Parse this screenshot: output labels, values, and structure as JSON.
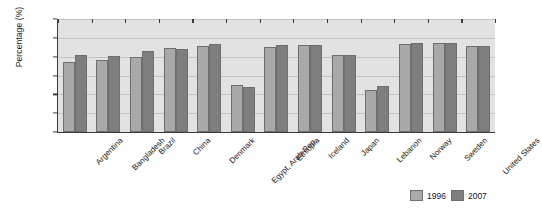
{
  "chart_data": {
    "type": "bar",
    "title": "",
    "xlabel": "",
    "ylabel": "Percentage (%)",
    "ylim": [
      0,
      60
    ],
    "ytick_step": 10,
    "ytick_labels": [
      "0.0",
      "10.0",
      "20.0",
      "30.0",
      "40.0",
      "50.0",
      "60.0"
    ],
    "grid": true,
    "legend_position": "bottom-right",
    "categories": [
      "Argentina",
      "Bangladesh",
      "Brazil",
      "China",
      "Denmark",
      "Egypt, Arab Rep.",
      "Ethiopia",
      "Iceland",
      "Japan",
      "Lebanon",
      "Norway",
      "Sweden",
      "United States"
    ],
    "series": [
      {
        "name": "1996",
        "color": "#a9a9a9",
        "values": [
          37.0,
          38.5,
          40.0,
          44.5,
          45.5,
          25.0,
          45.0,
          46.0,
          41.0,
          22.5,
          46.5,
          47.0,
          45.5
        ]
      },
      {
        "name": "2007",
        "color": "#7e7e7e",
        "values": [
          41.0,
          40.5,
          43.0,
          44.0,
          46.5,
          24.0,
          46.0,
          46.0,
          41.0,
          24.5,
          47.0,
          47.5,
          45.5
        ]
      }
    ]
  },
  "legend": {
    "items": [
      {
        "label": "1996"
      },
      {
        "label": "2007"
      }
    ]
  },
  "colors": {
    "plot_background": "#e2e2e2",
    "gridline": "#c2c2c2",
    "axis": "#3b3b3b",
    "series_1996": "#a9a9a9",
    "series_2007": "#7e7e7e"
  }
}
